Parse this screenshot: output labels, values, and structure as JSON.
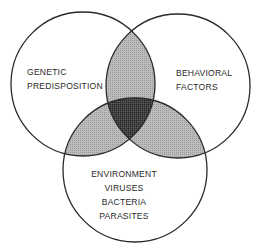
{
  "diagram": {
    "type": "venn",
    "sets": [
      {
        "id": "genetic",
        "lines": [
          "GENETIC",
          "PREDISPOSITION"
        ],
        "circle": {
          "cx": 83,
          "cy": 84,
          "r": 72
        }
      },
      {
        "id": "behavioral",
        "lines": [
          "BEHAVIORAL",
          "FACTORS"
        ],
        "circle": {
          "cx": 178,
          "cy": 86,
          "r": 72
        }
      },
      {
        "id": "environment",
        "lines": [
          "ENVIRONMENT",
          "VIRUSES",
          "BACTERIA",
          "PARASITES"
        ],
        "circle": {
          "cx": 135,
          "cy": 170,
          "r": 72
        }
      }
    ],
    "colors": {
      "outline": "#2a2a2a",
      "background": "#ffffff",
      "pair_overlap": "#b4b4b4",
      "triple_overlap": "#3c3c3c",
      "text": "#2a2a2a"
    }
  }
}
